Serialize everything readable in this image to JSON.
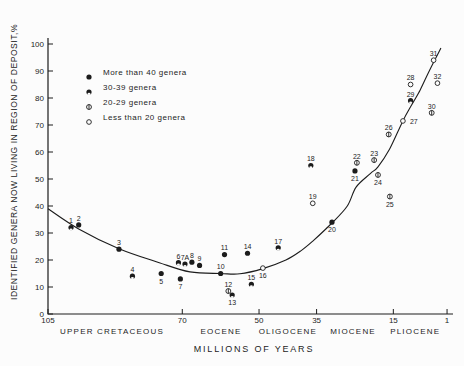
{
  "figure": {
    "background": "#fcfcfc",
    "ink": "#1c1c1c"
  },
  "legend": {
    "items": [
      {
        "symbol": "filled-circle",
        "group": "gt40",
        "label": "More than 40 genera"
      },
      {
        "symbol": "circle-bottom-notch",
        "group": "g30_39",
        "label": "30-39 genera"
      },
      {
        "symbol": "circle-vertical-bar",
        "group": "g20_29",
        "label": "20-29 genera"
      },
      {
        "symbol": "open-circle",
        "group": "lt20",
        "label": "Less than 20 genera"
      }
    ]
  },
  "chart_data": {
    "type": "scatter",
    "title": "",
    "xlabel": "MILLIONS OF YEARS",
    "ylabel": "IDENTIFIED GENERA NOW LIVING IN REGION OF DEPOSIT,%",
    "x_axis": {
      "unit": "millions of years",
      "direction": "reversed",
      "range": [
        105,
        1
      ],
      "ticks": [
        105,
        70,
        50,
        35,
        15,
        1
      ]
    },
    "y_axis": {
      "unit": "%",
      "range": [
        0,
        100
      ],
      "ticks": [
        0,
        10,
        20,
        30,
        40,
        50,
        60,
        70,
        80,
        90,
        100
      ]
    },
    "epochs": [
      {
        "label": "UPPER CRETACEOUS",
        "center_age": 88.3
      },
      {
        "label": "EOCENE",
        "center_age": 59.9
      },
      {
        "label": "OLIGOCENE",
        "center_age": 42.5
      },
      {
        "label": "MIOCENE",
        "center_age": 25.5
      },
      {
        "label": "PLIOCENE",
        "center_age": 9.3
      }
    ],
    "groups": {
      "gt40": "More than 40 genera",
      "g30_39": "30-39 genera",
      "g20_29": "20-29 genera",
      "lt20": "Less than 20 genera"
    },
    "points": [
      {
        "id": "1",
        "age_ma": 99,
        "percent": 32,
        "group": "g30_39",
        "label_pos": "above"
      },
      {
        "id": "2",
        "age_ma": 97,
        "percent": 33,
        "group": "gt40",
        "label_pos": "above"
      },
      {
        "id": "3",
        "age_ma": 86.5,
        "percent": 24,
        "group": "gt40",
        "label_pos": "above"
      },
      {
        "id": "4",
        "age_ma": 83,
        "percent": 14,
        "group": "g30_39",
        "label_pos": "above"
      },
      {
        "id": "5",
        "age_ma": 75.5,
        "percent": 15,
        "group": "gt40",
        "label_pos": "below"
      },
      {
        "id": "6",
        "age_ma": 71,
        "percent": 19,
        "group": "g30_39",
        "label_pos": "above"
      },
      {
        "id": "7A",
        "age_ma": 69.3,
        "percent": 18.5,
        "group": "g30_39",
        "label_pos": "above"
      },
      {
        "id": "7",
        "age_ma": 70.5,
        "percent": 13,
        "group": "gt40",
        "label_pos": "below"
      },
      {
        "id": "8",
        "age_ma": 67.5,
        "percent": 19.2,
        "group": "gt40",
        "label_pos": "above"
      },
      {
        "id": "9",
        "age_ma": 65.5,
        "percent": 18,
        "group": "gt40",
        "label_pos": "above"
      },
      {
        "id": "10",
        "age_ma": 60,
        "percent": 15,
        "group": "gt40",
        "label_pos": "above"
      },
      {
        "id": "11",
        "age_ma": 59,
        "percent": 22,
        "group": "gt40",
        "label_pos": "above"
      },
      {
        "id": "12",
        "age_ma": 58,
        "percent": 8.5,
        "group": "g20_29",
        "label_pos": "above"
      },
      {
        "id": "13",
        "age_ma": 57,
        "percent": 7,
        "group": "g30_39",
        "label_pos": "below"
      },
      {
        "id": "14",
        "age_ma": 53,
        "percent": 22.5,
        "group": "gt40",
        "label_pos": "above"
      },
      {
        "id": "15",
        "age_ma": 52,
        "percent": 11,
        "group": "g30_39",
        "label_pos": "above"
      },
      {
        "id": "16",
        "age_ma": 49,
        "percent": 17,
        "group": "lt20",
        "label_pos": "below"
      },
      {
        "id": "17",
        "age_ma": 45,
        "percent": 24.5,
        "group": "g30_39",
        "label_pos": "above"
      },
      {
        "id": "18",
        "age_ma": 36.5,
        "percent": 55,
        "group": "g30_39",
        "label_pos": "above"
      },
      {
        "id": "19",
        "age_ma": 36,
        "percent": 41,
        "group": "lt20",
        "label_pos": "above"
      },
      {
        "id": "20",
        "age_ma": 31,
        "percent": 34,
        "group": "gt40",
        "label_pos": "below"
      },
      {
        "id": "21",
        "age_ma": 25,
        "percent": 53,
        "group": "gt40",
        "label_pos": "below"
      },
      {
        "id": "22",
        "age_ma": 24.5,
        "percent": 56,
        "group": "g20_29",
        "label_pos": "above"
      },
      {
        "id": "23",
        "age_ma": 20,
        "percent": 57,
        "group": "g20_29",
        "label_pos": "above"
      },
      {
        "id": "24",
        "age_ma": 19,
        "percent": 51.5,
        "group": "g20_29",
        "label_pos": "below"
      },
      {
        "id": "25",
        "age_ma": 15.9,
        "percent": 43.5,
        "group": "g20_29",
        "label_pos": "below"
      },
      {
        "id": "26",
        "age_ma": 16.2,
        "percent": 66.5,
        "group": "g20_29",
        "label_pos": "above"
      },
      {
        "id": "27",
        "age_ma": 12.5,
        "percent": 71.5,
        "group": "lt20",
        "label_pos": "right"
      },
      {
        "id": "28",
        "age_ma": 10.5,
        "percent": 85,
        "group": "lt20",
        "label_pos": "above"
      },
      {
        "id": "29",
        "age_ma": 10.5,
        "percent": 79,
        "group": "g30_39",
        "label_pos": "above"
      },
      {
        "id": "30",
        "age_ma": 5,
        "percent": 74.5,
        "group": "g20_29",
        "label_pos": "above"
      },
      {
        "id": "31",
        "age_ma": 4.5,
        "percent": 94,
        "group": "lt20",
        "label_pos": "above"
      },
      {
        "id": "32",
        "age_ma": 3.5,
        "percent": 85.5,
        "group": "lt20",
        "label_pos": "above"
      }
    ],
    "trend_curve_age_pct": [
      [
        105,
        39
      ],
      [
        97,
        31.5
      ],
      [
        86.5,
        24.2
      ],
      [
        76,
        19
      ],
      [
        68,
        15.6
      ],
      [
        60,
        15
      ],
      [
        55,
        14.9
      ],
      [
        49,
        16.8
      ],
      [
        43,
        20
      ],
      [
        39,
        23.5
      ],
      [
        36,
        27
      ],
      [
        31,
        33.7
      ],
      [
        27,
        40
      ],
      [
        24.7,
        47
      ],
      [
        21,
        52
      ],
      [
        19,
        54.5
      ],
      [
        16,
        61
      ],
      [
        12.5,
        71.5
      ],
      [
        10.4,
        77
      ],
      [
        8,
        83
      ],
      [
        6,
        89
      ],
      [
        4.4,
        93.5
      ],
      [
        2.6,
        98.5
      ]
    ]
  }
}
